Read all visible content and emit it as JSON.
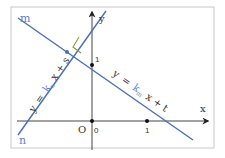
{
  "diagram": {
    "labels": {
      "line_m": "m",
      "line_n": "n",
      "axis_x": "x",
      "axis_y": "y",
      "origin": "O",
      "origin_zero": "0",
      "y_tick_one": "1",
      "x_tick_one": "1",
      "angle_mark": "L"
    },
    "equations": {
      "line_n": {
        "y": "y",
        "eq": "=",
        "k": "k",
        "sub": "n",
        "rest": "x + s"
      },
      "line_m": {
        "y": "y",
        "eq": "=",
        "k": "k",
        "sub": "m",
        "rest": "x + t"
      }
    },
    "colors": {
      "frame": "#c8c8c8",
      "axis": "#333333",
      "line": "#4a6fb5",
      "k_label": "#5b84c9",
      "angle": "#8a9a3a",
      "text": "#333333"
    }
  }
}
